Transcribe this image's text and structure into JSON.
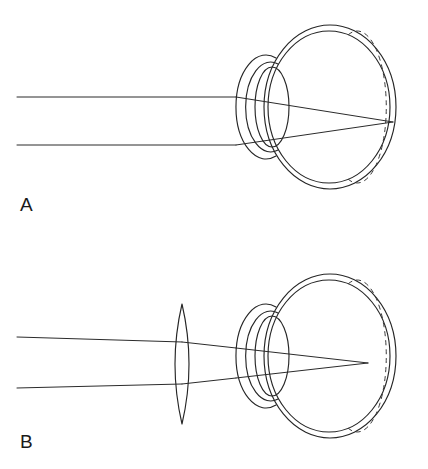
{
  "figure": {
    "background_color": "#ffffff",
    "line_color": "#262626",
    "width": 428,
    "height": 469
  },
  "panels": [
    {
      "id": "A",
      "label": "A",
      "label_position": {
        "x": 20,
        "y": 211
      },
      "description": "Uncorrected eye: parallel light rays refract at the cornea and crystalline lens and converge to a focal point behind the retina",
      "condition": "uncorrected",
      "has_external_lens": false,
      "focus_on_retina": false,
      "incoming_rays": [
        {
          "name": "upper-ray",
          "x1": 17,
          "y1": 97,
          "x2": 236,
          "y2": 97
        },
        {
          "name": "lower-ray",
          "x1": 17,
          "y1": 145,
          "x2": 236,
          "y2": 145
        }
      ],
      "refracted_rays": [
        {
          "name": "upper-refracted-ray",
          "x1": 236,
          "y1": 97,
          "x2": 393,
          "y2": 122
        },
        {
          "name": "lower-refracted-ray",
          "x1": 236,
          "y1": 145,
          "x2": 393,
          "y2": 122
        }
      ],
      "focal_point": {
        "x": 393,
        "y": 122
      },
      "eye": {
        "globe_outer": {
          "cx": 330,
          "cy": 107,
          "rx": 66,
          "ry": 82
        },
        "globe_inner": {
          "cx": 329,
          "cy": 107,
          "rx": 61,
          "ry": 76
        },
        "cornea_outer": {
          "cx": 262,
          "cy": 107,
          "rx": 30,
          "ry": 52
        },
        "cornea_inner": {
          "cx": 264,
          "cy": 107,
          "rx": 25,
          "ry": 45
        },
        "crystalline_lens": {
          "cx": 272,
          "cy": 107,
          "rx": 17,
          "ry": 40
        },
        "retina_dashed": {
          "cx": 330,
          "cy": 107,
          "rx": 29,
          "ry": 76
        }
      }
    },
    {
      "id": "B",
      "label": "B",
      "label_position": {
        "x": 20,
        "y": 448
      },
      "description": "Corrected eye: a biconvex external lens converges the parallel rays so that the focal point falls on the retina",
      "condition": "corrected",
      "has_external_lens": true,
      "focus_on_retina": true,
      "external_lens": {
        "name": "biconvex-corrective-lens",
        "cx": 182,
        "cy": 364,
        "half_width": 14,
        "half_height": 60,
        "top": {
          "x": 182,
          "y": 304
        },
        "bottom": {
          "x": 182,
          "y": 424
        }
      },
      "incoming_rays": [
        {
          "name": "upper-ray",
          "x1": 17,
          "y1": 337,
          "x2": 182,
          "y2": 342
        },
        {
          "name": "lower-ray",
          "x1": 17,
          "y1": 388,
          "x2": 182,
          "y2": 384
        }
      ],
      "lens_to_eye_rays": [
        {
          "name": "upper-lens-ray",
          "x1": 182,
          "y1": 342,
          "x2": 236,
          "y2": 348
        },
        {
          "name": "lower-lens-ray",
          "x1": 182,
          "y1": 384,
          "x2": 236,
          "y2": 378
        }
      ],
      "refracted_rays": [
        {
          "name": "upper-refracted-ray",
          "x1": 236,
          "y1": 348,
          "x2": 368,
          "y2": 363
        },
        {
          "name": "lower-refracted-ray",
          "x1": 236,
          "y1": 378,
          "x2": 368,
          "y2": 363
        }
      ],
      "focal_point": {
        "x": 368,
        "y": 363
      },
      "eye": {
        "globe_outer": {
          "cx": 330,
          "cy": 356,
          "rx": 66,
          "ry": 82
        },
        "globe_inner": {
          "cx": 329,
          "cy": 356,
          "rx": 61,
          "ry": 76
        },
        "cornea_outer": {
          "cx": 262,
          "cy": 356,
          "rx": 30,
          "ry": 52
        },
        "cornea_inner": {
          "cx": 264,
          "cy": 356,
          "rx": 25,
          "ry": 45
        },
        "crystalline_lens": {
          "cx": 272,
          "cy": 356,
          "rx": 17,
          "ry": 40
        },
        "retina_dashed": {
          "cx": 330,
          "cy": 356,
          "rx": 29,
          "ry": 76
        }
      }
    }
  ]
}
